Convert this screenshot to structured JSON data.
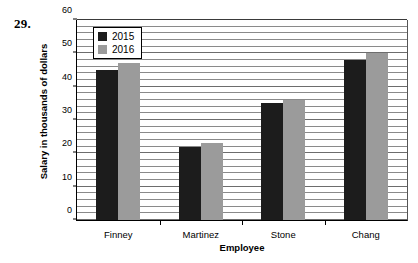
{
  "problem_number": "29.",
  "chart_data": {
    "type": "bar",
    "title": "",
    "subtitle": "",
    "xlabel": "Employee",
    "ylabel": "Salary in thousands of dollars",
    "categories": [
      "Finney",
      "Martinez",
      "Stone",
      "Chang"
    ],
    "series": [
      {
        "name": "2015",
        "color": "#1c1c1c",
        "values": [
          45,
          22,
          35,
          48
        ]
      },
      {
        "name": "2016",
        "color": "#9b9b9b",
        "values": [
          47,
          23,
          36,
          50
        ]
      }
    ],
    "ylim": [
      0,
      60
    ],
    "ytick_labels": [
      "0",
      "10",
      "20",
      "30",
      "40",
      "50",
      "60"
    ],
    "ytick_values": [
      0,
      10,
      20,
      30,
      40,
      50,
      60
    ],
    "ytick_interval": 10,
    "gridline_interval": 2,
    "grid": true,
    "grid_axis": "y",
    "legend_position": "top-left-inside",
    "legend_entries": [
      "2015",
      "2016"
    ]
  }
}
